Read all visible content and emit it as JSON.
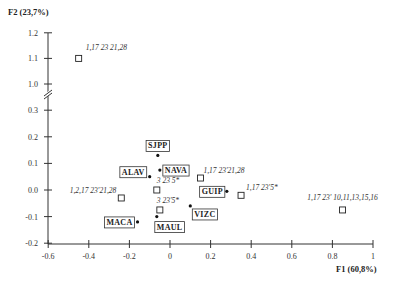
{
  "chart_data": {
    "type": "scatter",
    "title": "",
    "xlabel": "F1 (60,8%)",
    "ylabel": "F2 (23,7%)",
    "xlim": [
      -0.6,
      1.0
    ],
    "ylim": [
      -0.2,
      1.2
    ],
    "y_axis_break": [
      0.3,
      1.0
    ],
    "grid": false,
    "x_ticks": [
      "-0.6",
      "-0.4",
      "-0.2",
      "0",
      "0.2",
      "0.4",
      "0.6",
      "0.8",
      "1"
    ],
    "y_ticks": [
      "1.2",
      "1.1",
      "1.0",
      "0.3",
      "0.2",
      "0.1",
      "0.0",
      "-0.1",
      "-0.2"
    ],
    "series": [
      {
        "name": "regions",
        "marker": "dot",
        "points": [
          {
            "label": "SJPP",
            "x": -0.06,
            "y": 0.13
          },
          {
            "label": "NAVA",
            "x": -0.05,
            "y": 0.075
          },
          {
            "label": "ALAV",
            "x": -0.1,
            "y": 0.05
          },
          {
            "label": "GUIP",
            "x": 0.28,
            "y": -0.005
          },
          {
            "label": "VIZC",
            "x": 0.1,
            "y": -0.06
          },
          {
            "label": "MAUL",
            "x": -0.065,
            "y": -0.1
          },
          {
            "label": "MACA",
            "x": -0.16,
            "y": -0.12
          }
        ]
      },
      {
        "name": "genotypes",
        "marker": "square",
        "points": [
          {
            "label": "1,17 23 21,28",
            "x": -0.45,
            "y": 1.1
          },
          {
            "label": "1,17 23'21,28",
            "x": 0.15,
            "y": 0.045
          },
          {
            "label": "3 23 5*",
            "x": -0.065,
            "y": 0.0
          },
          {
            "label": "1,17 23'5*",
            "x": 0.35,
            "y": -0.02
          },
          {
            "label": "1,2,17 23'21,28",
            "x": -0.24,
            "y": -0.03
          },
          {
            "label": "3 23'5*",
            "x": -0.05,
            "y": -0.075
          },
          {
            "label": "1,17 23' 10,11,13,15,16",
            "x": 0.85,
            "y": -0.075
          }
        ]
      }
    ]
  }
}
